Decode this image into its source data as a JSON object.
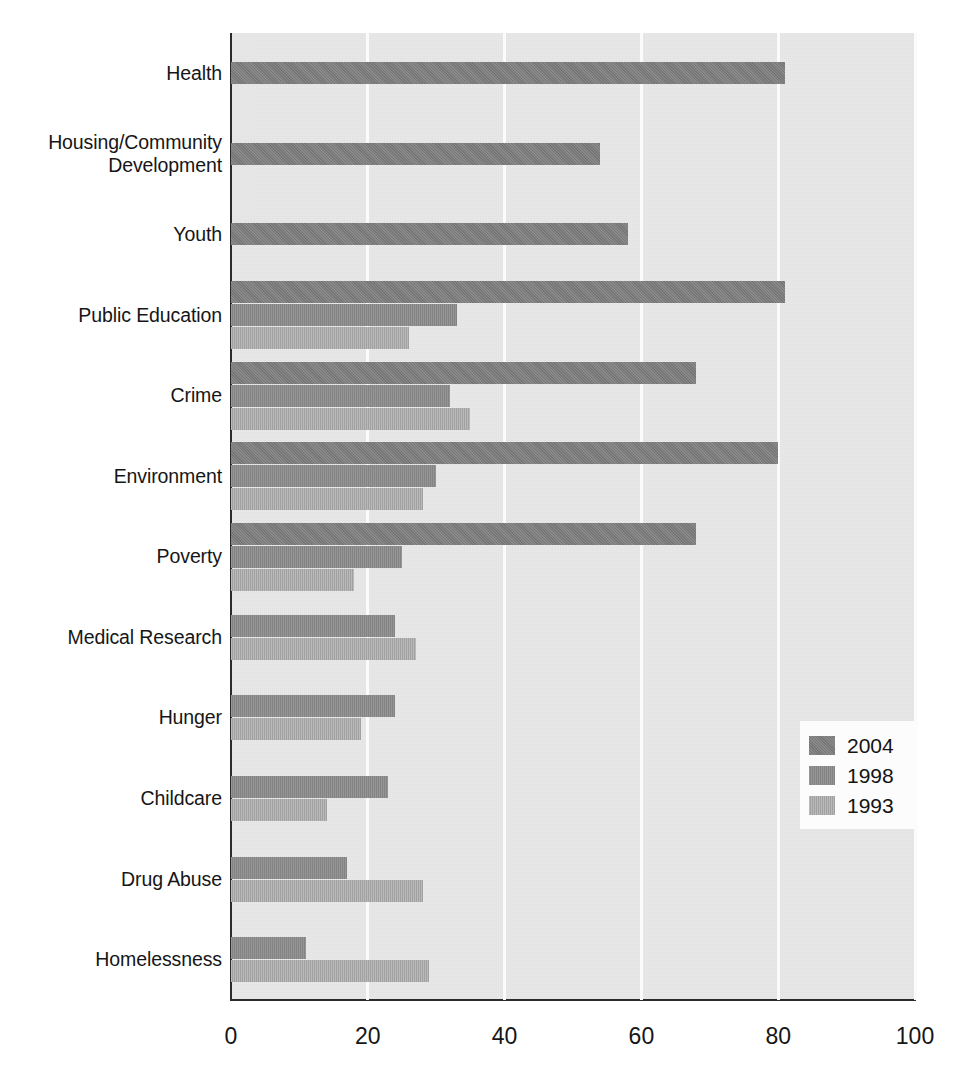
{
  "chart_data": {
    "type": "bar",
    "orientation": "horizontal",
    "title": "",
    "subtitle": "",
    "xlabel": "",
    "ylabel": "",
    "xlim": [
      0,
      100
    ],
    "ylim": null,
    "grid": true,
    "grid_axis": "x",
    "legend_position": "center-right",
    "xticks": [
      0,
      20,
      40,
      60,
      80,
      100
    ],
    "xtick_labels": [
      "0",
      "20",
      "40",
      "60",
      "80",
      "100"
    ],
    "categories": [
      "Health",
      "Housing/Community\nDevelopment",
      "Youth",
      "Public Education",
      "Crime",
      "Environment",
      "Poverty",
      "Medical Research",
      "Hunger",
      "Childcare",
      "Drug Abuse",
      "Homelessness"
    ],
    "series": [
      {
        "name": "2004",
        "color": "#7d7d7d",
        "values": [
          81,
          54,
          58,
          81,
          68,
          80,
          68,
          null,
          null,
          null,
          null,
          null
        ]
      },
      {
        "name": "1998",
        "color": "#8a8a8a",
        "values": [
          null,
          null,
          null,
          33,
          32,
          30,
          25,
          24,
          24,
          23,
          17,
          11
        ]
      },
      {
        "name": "1993",
        "color": "#a6a6a6",
        "values": [
          null,
          null,
          null,
          26,
          35,
          28,
          18,
          27,
          19,
          14,
          28,
          29
        ]
      }
    ]
  },
  "categories": [
    {
      "id": "health",
      "label": "Health"
    },
    {
      "id": "housing",
      "label": "Housing/Community",
      "label2": "Development"
    },
    {
      "id": "youth",
      "label": "Youth"
    },
    {
      "id": "public-education",
      "label": "Public Education"
    },
    {
      "id": "crime",
      "label": "Crime"
    },
    {
      "id": "environment",
      "label": "Environment"
    },
    {
      "id": "poverty",
      "label": "Poverty"
    },
    {
      "id": "medical-research",
      "label": "Medical Research"
    },
    {
      "id": "hunger",
      "label": "Hunger"
    },
    {
      "id": "childcare",
      "label": "Childcare"
    },
    {
      "id": "drug-abuse",
      "label": "Drug Abuse"
    },
    {
      "id": "homelessness",
      "label": "Homelessness"
    }
  ],
  "axis": {
    "ticks": [
      {
        "value": 0,
        "label": "0"
      },
      {
        "value": 20,
        "label": "20"
      },
      {
        "value": 40,
        "label": "40"
      },
      {
        "value": 60,
        "label": "60"
      },
      {
        "value": 80,
        "label": "80"
      },
      {
        "value": 100,
        "label": "100"
      }
    ]
  },
  "legend": {
    "entries": [
      {
        "label": "2004",
        "color": "#7d7d7d",
        "swatch": "legend-swatch-2004"
      },
      {
        "label": "1998",
        "color": "#8a8a8a",
        "swatch": "legend-swatch-1998"
      },
      {
        "label": "1993",
        "color": "#a6a6a6",
        "swatch": "legend-swatch-1993"
      }
    ]
  },
  "colors": {
    "plot_background": "#e3e3e3",
    "gridline": "#fbfbfb",
    "axis": "#2b2b2b",
    "text": "#161616",
    "series_2004": "#7d7d7d",
    "series_1998": "#8a8a8a",
    "series_1993": "#a6a6a6",
    "legend_background": "#fcfcfc"
  }
}
